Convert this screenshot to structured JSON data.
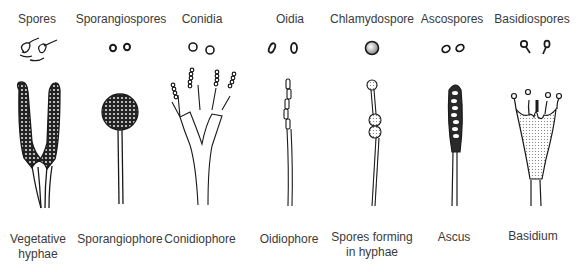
{
  "diagram": {
    "type": "fungal spore and spore-bearing structure comparison",
    "columns": [
      {
        "spore_label": "Spores",
        "structure_label": "Vegetative hyphae",
        "structure_lines": [
          "Vegetative",
          "hyphae"
        ]
      },
      {
        "spore_label": "Sporangiospores",
        "structure_label": "Sporangiophore",
        "structure_lines": [
          "Sporangiophore"
        ]
      },
      {
        "spore_label": "Conidia",
        "structure_label": "Conidiophore",
        "structure_lines": [
          "Conidiophore"
        ]
      },
      {
        "spore_label": "Oidia",
        "structure_label": "Oidiophore",
        "structure_lines": [
          "Oidiophore"
        ]
      },
      {
        "spore_label": "Chlamydospore",
        "structure_label": "Spores forming in hyphae",
        "structure_lines": [
          "Spores forming",
          "in hyphae"
        ]
      },
      {
        "spore_label": "Ascospores",
        "structure_label": "Ascus",
        "structure_lines": [
          "Ascus"
        ]
      },
      {
        "spore_label": "Basidiospores",
        "structure_label": "Basidium",
        "structure_lines": [
          "Basidium"
        ]
      }
    ],
    "colors": {
      "ink": "#1a1a1a",
      "text": "#3a3a3a",
      "background": "#ffffff"
    }
  }
}
